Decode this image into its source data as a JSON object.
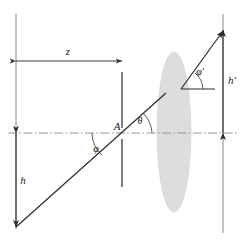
{
  "figure": {
    "background_color": "#ffffff",
    "line_color": "#3a3a3a",
    "axis_color": "#8f8f8f",
    "lens_fill_color": "#dcdcdc",
    "label_color": "#1a1a1a",
    "width": 243,
    "height": 244
  },
  "labels": {
    "object_distance": "z",
    "object_height": "h",
    "image_height": "h′",
    "vertex_point": "A",
    "incident_field_angle": "φ",
    "ray_angle": "θ",
    "exit_field_angle": "φ′"
  },
  "elements": {
    "left_vertical_line": "object-plane-reference-line",
    "right_vertical_line": "image-plane-reference-line",
    "optical_axis": "optical-axis-dash-dot",
    "lens": "thin-lens-ellipse",
    "incident_ray": "incident-ray",
    "exit_ray": "exit-ray",
    "z_dimension": "z-dimension-arrow",
    "h_dimension": "h-dimension-arrow",
    "h_prime_dimension": "h-prime-dimension-arrow"
  },
  "geometry": {
    "optical_axis_y": 133,
    "left_line_x": 16,
    "right_line_x": 223,
    "lens_center_x": 174,
    "lens_rx": 17,
    "lens_ry": 80,
    "object_plane_x": 122,
    "z_dimension_y": 61,
    "object_bottom_y": 227,
    "image_top_y": 29
  }
}
